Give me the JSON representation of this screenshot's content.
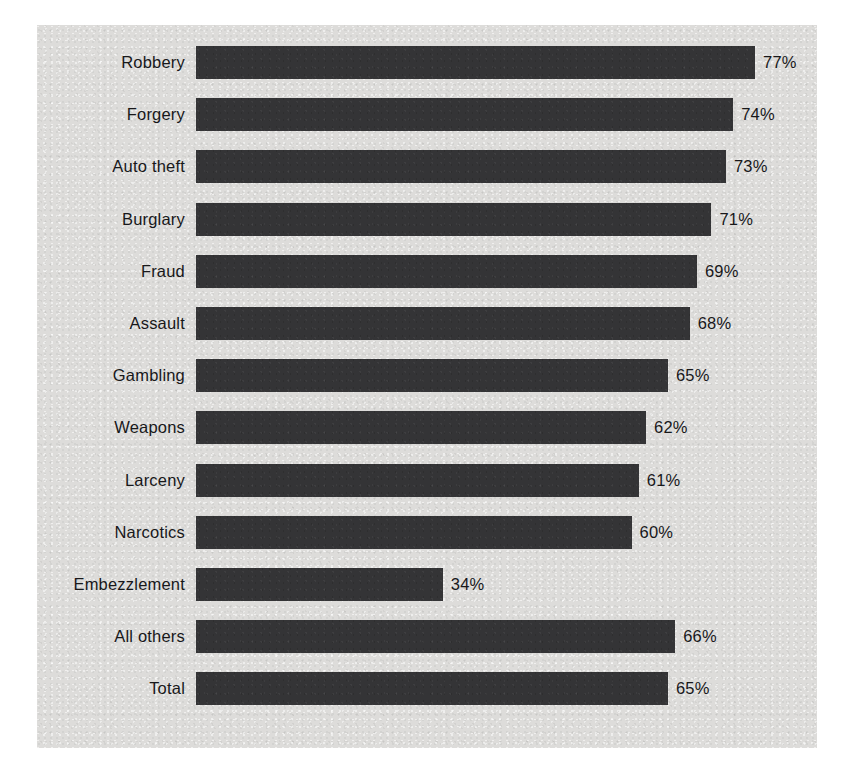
{
  "figure": {
    "panel_background": "#dddcda",
    "bar_color": "#343436",
    "text_color": "#18181a"
  },
  "chart_data": {
    "type": "bar",
    "orientation": "horizontal",
    "title": "",
    "subtitle": "",
    "xlabel": "",
    "ylabel": "",
    "xlim": [
      0,
      100
    ],
    "grid": false,
    "legend": null,
    "value_suffix": "%",
    "categories": [
      "Robbery",
      "Forgery",
      "Auto theft",
      "Burglary",
      "Fraud",
      "Assault",
      "Gambling",
      "Weapons",
      "Larceny",
      "Narcotics",
      "Embezzlement",
      "All others",
      "Total"
    ],
    "values": [
      77,
      74,
      73,
      71,
      69,
      68,
      65,
      62,
      61,
      60,
      34,
      66,
      65
    ],
    "data_labels": [
      "77%",
      "74%",
      "73%",
      "71%",
      "69%",
      "68%",
      "65%",
      "62%",
      "61%",
      "60%",
      "34%",
      "66%",
      "65%"
    ],
    "tick_labels": [],
    "annotations": []
  }
}
